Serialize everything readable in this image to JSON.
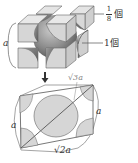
{
  "diagram": {
    "top_cube": {
      "corner_atom_label": {
        "numerator": "1",
        "denominator": "8",
        "unit": "個"
      },
      "center_atom_label": {
        "value": "1",
        "unit": "個"
      },
      "edge_label": "a"
    },
    "arrow": "down-arrow",
    "cross_section": {
      "diagonal_label": "√3a",
      "right_edge_label": "a",
      "left_edge_label": "a",
      "bottom_edge_label": "√2a"
    },
    "colors": {
      "cube_face": "#d6d6d6",
      "cube_face_light": "#e6e6e6",
      "sphere_dark": "#6e6e6e",
      "sphere_mid": "#a8a8a8",
      "section_fill": "#d9d9d9",
      "line": "#555555"
    }
  }
}
